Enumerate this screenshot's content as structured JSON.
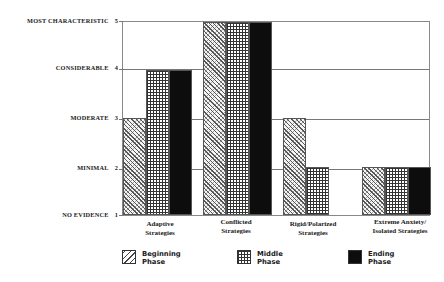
{
  "chart_data": {
    "type": "bar",
    "title": "",
    "xlabel": "",
    "ylabel": "",
    "ylim": [
      1,
      5
    ],
    "yticks": [
      {
        "value": 5,
        "label": "MOST CHARACTERISTIC"
      },
      {
        "value": 4,
        "label": "CONSIDERABLE"
      },
      {
        "value": 3,
        "label": "MODERATE"
      },
      {
        "value": 2,
        "label": "MINIMAL"
      },
      {
        "value": 1,
        "label": "NO EVIDENCE"
      }
    ],
    "categories": [
      [
        "Adaptive",
        "Strategies"
      ],
      [
        "Conflicted",
        "Strategies"
      ],
      [
        "Rigid/Polarized",
        "Strategies"
      ],
      [
        "Extreme Anxiety/",
        "Isolated Strategies"
      ]
    ],
    "series": [
      {
        "name": "Beginning Phase",
        "pattern": "diagonal-hatch",
        "values": [
          3,
          5,
          3,
          2
        ]
      },
      {
        "name": "Middle Phase",
        "pattern": "grid-hatch",
        "values": [
          4,
          5,
          2,
          2
        ]
      },
      {
        "name": "Ending Phase",
        "pattern": "solid-black",
        "values": [
          4,
          5,
          1,
          2
        ]
      }
    ],
    "grid": true,
    "legend_position": "bottom"
  },
  "yaxis": {
    "labels": [
      {
        "text": "MOST CHARACTERISTIC",
        "num": "5"
      },
      {
        "text": "CONSIDERABLE",
        "num": "4"
      },
      {
        "text": "MODERATE",
        "num": "3"
      },
      {
        "text": "MINIMAL",
        "num": "2"
      },
      {
        "text": "NO EVIDENCE",
        "num": "1"
      }
    ]
  },
  "xaxis": {
    "labels": [
      {
        "line1": "Adaptive",
        "line2": "Strategies"
      },
      {
        "line1": "Conflicted",
        "line2": "Strategies"
      },
      {
        "line1": "Rigid/Polarized",
        "line2": "Strategies"
      },
      {
        "line1": "Extreme Anxiety/",
        "line2": "Isolated Strategies"
      }
    ]
  },
  "legend": {
    "items": [
      {
        "line1": "Beginning",
        "line2": "Phase"
      },
      {
        "line1": "Middle",
        "line2": "Phase"
      },
      {
        "line1": "Ending",
        "line2": "Phase"
      }
    ]
  }
}
